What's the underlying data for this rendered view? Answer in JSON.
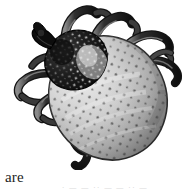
{
  "page": {
    "kind": "scanned-page-fragment",
    "background_color": "#ffffff",
    "width": 189,
    "height": 191
  },
  "figure": {
    "name": "tick-illustration",
    "style": "grayscale stipple engraving",
    "colors": {
      "scutum_dark": "#1a1a1a",
      "scutum_speckle": "#e8e8e8",
      "abdomen_light": "#d8d8d8",
      "abdomen_mid": "#b4b4b4",
      "abdomen_shadow": "#8a8a8a",
      "abdomen_edge": "#6e6e6e",
      "puncta": "#4a4a4a",
      "leg_dark": "#2a2a2a",
      "leg_mid": "#6a6a6a",
      "leg_highlight": "#d0d0d0",
      "outline": "#111111"
    },
    "parts": {
      "capitulum": "capitulum-mouthparts",
      "scutum": "scutum-shield",
      "abdomen": "idiosoma-abdomen",
      "legs_count": 8
    }
  },
  "text": {
    "word_are": "are",
    "clipped_line": "· — — ·· — — ·· —"
  }
}
